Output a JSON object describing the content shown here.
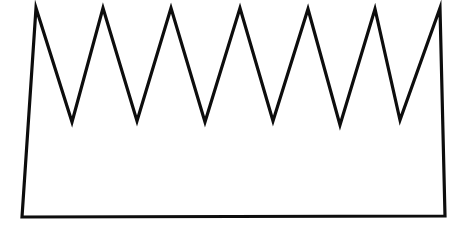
{
  "figure": {
    "background_color": "#ffffff",
    "fill_color": "#ffffff",
    "stroke_color": "#0d0d0d",
    "stroke_width": 3.2,
    "canvas": {
      "width": 464,
      "height": 231
    },
    "peak_count": 7,
    "valley_count": 6,
    "points": [
      {
        "name": "bottom-left-corner",
        "x": 22,
        "y": 217
      },
      {
        "name": "peak-1",
        "x": 36,
        "y": 8
      },
      {
        "name": "valley-1",
        "x": 72,
        "y": 122
      },
      {
        "name": "peak-2",
        "x": 103,
        "y": 8
      },
      {
        "name": "valley-2",
        "x": 137,
        "y": 121
      },
      {
        "name": "peak-3",
        "x": 171,
        "y": 8
      },
      {
        "name": "valley-3",
        "x": 205,
        "y": 122
      },
      {
        "name": "peak-4",
        "x": 240,
        "y": 8
      },
      {
        "name": "valley-4",
        "x": 273,
        "y": 121
      },
      {
        "name": "peak-5",
        "x": 308,
        "y": 9
      },
      {
        "name": "valley-5",
        "x": 340,
        "y": 125
      },
      {
        "name": "peak-6",
        "x": 375,
        "y": 9
      },
      {
        "name": "valley-6",
        "x": 400,
        "y": 120
      },
      {
        "name": "peak-7",
        "x": 440,
        "y": 8
      },
      {
        "name": "bottom-right-corner",
        "x": 445,
        "y": 216
      }
    ],
    "path_d": "M 22 217 L 36 8 L 72 122 L 103 8 L 137 121 L 171 8 L 205 122 L 240 8 L 273 121 L 308 9 L 340 125 L 375 9 L 400 120 L 440 8 L 445 216 Z"
  }
}
